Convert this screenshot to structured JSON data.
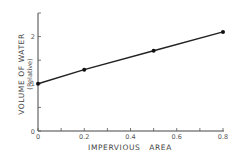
{
  "chart_data": {
    "type": "line",
    "title": "",
    "xlabel": "IMPERVIOUS   AREA",
    "ylabel": "VOLUME OF WATER",
    "ylabel_sub": "(Relative)",
    "x": [
      0,
      0.2,
      0.5,
      0.8
    ],
    "series": [
      {
        "name": "Volume of water",
        "values": [
          1.0,
          1.3,
          1.7,
          2.1
        ]
      }
    ],
    "xlim": [
      0,
      0.8
    ],
    "ylim": [
      0,
      2.5
    ],
    "x_ticks": [
      0,
      0.1,
      0.2,
      0.3,
      0.4,
      0.5,
      0.6,
      0.7,
      0.8
    ],
    "x_tick_labels": [
      {
        "value": 0,
        "label": "0"
      },
      {
        "value": 0.2,
        "label": "0.2"
      },
      {
        "value": 0.4,
        "label": "0.4"
      },
      {
        "value": 0.6,
        "label": "0.6"
      },
      {
        "value": 0.8,
        "label": "0.8"
      }
    ],
    "y_ticks": [
      0,
      0.5,
      1,
      1.5,
      2
    ],
    "y_tick_labels": [
      {
        "value": 0,
        "label": "0"
      },
      {
        "value": 1,
        "label": "1"
      },
      {
        "value": 2,
        "label": "2"
      }
    ],
    "grid": false,
    "legend": "none"
  }
}
